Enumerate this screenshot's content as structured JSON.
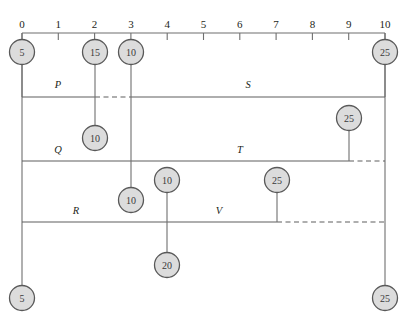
{
  "diagram": {
    "type": "timeline-network-diagram",
    "axis": {
      "orientation": "horizontal",
      "position": "top",
      "min": 0,
      "max": 10,
      "step": 1,
      "tick_labels": [
        "0",
        "1",
        "2",
        "3",
        "4",
        "5",
        "6",
        "7",
        "8",
        "9",
        "10"
      ],
      "pixel_start_x": 22,
      "pixel_end_x": 385,
      "pixel_y": 33
    },
    "colors": {
      "node_fill": "#dcdcdc",
      "node_stroke": "#595959",
      "line": "#5e5e5e",
      "axis": "#6f6f6f",
      "text": "#231f20"
    },
    "rows": [
      {
        "id": "row-top",
        "y": 97,
        "labels": [
          {
            "name": "P",
            "x": 58,
            "y": 88
          },
          {
            "name": "S",
            "x": 248,
            "y": 88
          }
        ],
        "segments": [
          {
            "style": "solid",
            "x1": 22,
            "x2": 95
          },
          {
            "style": "dashed",
            "x1": 95,
            "x2": 131
          },
          {
            "style": "solid",
            "x1": 131,
            "x2": 385
          }
        ]
      },
      {
        "id": "row-middle",
        "y": 161,
        "labels": [
          {
            "name": "Q",
            "x": 58,
            "y": 153
          },
          {
            "name": "T",
            "x": 240,
            "y": 153
          }
        ],
        "segments": [
          {
            "style": "solid",
            "x1": 22,
            "x2": 349
          },
          {
            "style": "dashed",
            "x1": 349,
            "x2": 385
          }
        ]
      },
      {
        "id": "row-bottom",
        "y": 222,
        "labels": [
          {
            "name": "R",
            "x": 76,
            "y": 214
          },
          {
            "name": "V",
            "x": 219,
            "y": 214
          }
        ],
        "segments": [
          {
            "style": "solid",
            "x1": 22,
            "x2": 277
          },
          {
            "style": "dashed",
            "x1": 277,
            "x2": 385
          }
        ]
      }
    ],
    "frame_verticals": [
      {
        "x": 22,
        "y1": 33,
        "y2": 290
      },
      {
        "x": 385,
        "y1": 33,
        "y2": 290
      }
    ],
    "nodes": [
      {
        "id": "n1",
        "value": "5",
        "cx": 22,
        "cy": 52,
        "r": 12.5,
        "stem": {
          "x": 22,
          "y1": 64,
          "y2": 97
        }
      },
      {
        "id": "n2",
        "value": "15",
        "cx": 95,
        "cy": 52,
        "r": 12.5,
        "stem": {
          "x": 95,
          "y1": 64,
          "y2": 126
        }
      },
      {
        "id": "n3",
        "value": "10",
        "cx": 131,
        "cy": 52,
        "r": 12.5,
        "stem": {
          "x": 131,
          "y1": 64,
          "y2": 188
        }
      },
      {
        "id": "n4",
        "value": "25",
        "cx": 385,
        "cy": 52,
        "r": 12.5,
        "stem": {
          "x": 385,
          "y1": 64,
          "y2": 97
        }
      },
      {
        "id": "n5",
        "value": "10",
        "cx": 95,
        "cy": 138,
        "r": 12.5,
        "stem": null
      },
      {
        "id": "n6",
        "value": "25",
        "cx": 349,
        "cy": 118,
        "r": 12.5,
        "stem": {
          "x": 349,
          "y1": 130,
          "y2": 161
        }
      },
      {
        "id": "n7",
        "value": "10",
        "cx": 167,
        "cy": 180,
        "r": 12.5,
        "stem": {
          "x": 167,
          "y1": 192,
          "y2": 253
        }
      },
      {
        "id": "n8",
        "value": "10",
        "cx": 131,
        "cy": 200,
        "r": 12.5,
        "stem": null
      },
      {
        "id": "n9",
        "value": "25",
        "cx": 277,
        "cy": 180,
        "r": 12.5,
        "stem": {
          "x": 277,
          "y1": 192,
          "y2": 222
        }
      },
      {
        "id": "n10",
        "value": "20",
        "cx": 167,
        "cy": 265,
        "r": 12.5,
        "stem": null
      },
      {
        "id": "n11",
        "value": "5",
        "cx": 22,
        "cy": 298,
        "r": 12.5,
        "stem": null
      },
      {
        "id": "n12",
        "value": "25",
        "cx": 385,
        "cy": 298,
        "r": 12.5,
        "stem": null
      }
    ]
  }
}
